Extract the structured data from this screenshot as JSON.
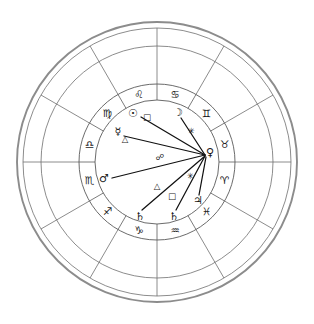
{
  "chart": {
    "type": "astrological-natal-wheel",
    "geometry": {
      "center_x": 157,
      "center_y": 162,
      "radius_outer_rim": 140,
      "radius_outer_circle": 134,
      "radius_house_wheel": 116,
      "radius_zodiac_outer": 78,
      "radius_zodiac_inner": 62,
      "radius_inner_area": 62
    },
    "colors": {
      "rim": "#8c8c8c",
      "line": "#6e6e6e",
      "zodiac_ring": "#5a5a5a",
      "aspect_line": "#111111",
      "glyph": "#1a1a1a",
      "background": "#ffffff"
    },
    "house_spokes_deg": [
      0,
      30,
      60,
      90,
      120,
      150,
      180,
      210,
      240,
      270,
      300,
      330
    ],
    "zodiac_signs": [
      {
        "name": "Cancer",
        "glyph": "♋",
        "angle_deg": 75,
        "label": "cancer"
      },
      {
        "name": "Leo",
        "glyph": "♌",
        "angle_deg": 105,
        "label": "leo"
      },
      {
        "name": "Virgo",
        "glyph": "♍",
        "angle_deg": 135,
        "label": "virgo"
      },
      {
        "name": "Libra",
        "glyph": "♎",
        "angle_deg": 165,
        "label": "libra"
      },
      {
        "name": "Scorpio",
        "glyph": "♏",
        "angle_deg": 195,
        "label": "scorpio"
      },
      {
        "name": "Sagittarius",
        "glyph": "♐",
        "angle_deg": 225,
        "label": "sagittarius"
      },
      {
        "name": "Capricorn",
        "glyph": "♑",
        "angle_deg": 255,
        "label": "capricorn"
      },
      {
        "name": "Aquarius",
        "glyph": "♒",
        "angle_deg": 285,
        "label": "aquarius"
      },
      {
        "name": "Pisces",
        "glyph": "♓",
        "angle_deg": 315,
        "label": "pisces"
      },
      {
        "name": "Aries",
        "glyph": "♈",
        "angle_deg": 345,
        "label": "aries"
      },
      {
        "name": "Taurus",
        "glyph": "♉",
        "angle_deg": 15,
        "label": "taurus"
      },
      {
        "name": "Gemini",
        "glyph": "♊",
        "angle_deg": 45,
        "label": "gemini"
      }
    ],
    "planets": [
      {
        "name": "Sun",
        "glyph": "☉",
        "x": 133,
        "y": 113,
        "label": "sun"
      },
      {
        "name": "Moon",
        "glyph": "☽",
        "x": 178,
        "y": 112,
        "label": "moon"
      },
      {
        "name": "Mercury",
        "glyph": "☿",
        "x": 118,
        "y": 131,
        "label": "mercury"
      },
      {
        "name": "Venus",
        "glyph": "♀",
        "x": 210,
        "y": 152,
        "label": "venus"
      },
      {
        "name": "Mars",
        "glyph": "♂",
        "x": 104,
        "y": 178,
        "label": "mars"
      },
      {
        "name": "Jupiter",
        "glyph": "♃",
        "x": 198,
        "y": 200,
        "label": "jupiter"
      },
      {
        "name": "Saturn",
        "glyph": "♄",
        "x": 140,
        "y": 216,
        "label": "saturn-1"
      },
      {
        "name": "Saturn",
        "glyph": "♄",
        "x": 174,
        "y": 216,
        "label": "saturn-2"
      }
    ],
    "aspect_markers": [
      {
        "name": "Square",
        "glyph": "□",
        "x": 147,
        "y": 117,
        "label": "square-sun-venus"
      },
      {
        "name": "Trine",
        "glyph": "△",
        "x": 125,
        "y": 139,
        "label": "trine-mercury-venus"
      },
      {
        "name": "Sextile",
        "glyph": "✳",
        "x": 191,
        "y": 131,
        "label": "sextile-upper"
      },
      {
        "name": "Opposition",
        "glyph": "☍",
        "x": 160,
        "y": 157,
        "label": "opposition-mars-venus"
      },
      {
        "name": "Sextile",
        "glyph": "✳",
        "x": 190,
        "y": 176,
        "label": "sextile-lower"
      },
      {
        "name": "Trine",
        "glyph": "△",
        "x": 157,
        "y": 186,
        "label": "trine-saturn-venus"
      },
      {
        "name": "Square",
        "glyph": "□",
        "x": 172,
        "y": 196,
        "label": "square-saturn-venus"
      }
    ],
    "aspect_lines": [
      {
        "from": "Sun",
        "x1": 141,
        "y1": 117,
        "x2": 205,
        "y2": 155,
        "label": "line-sun-venus"
      },
      {
        "from": "Moon",
        "x1": 181,
        "y1": 118,
        "x2": 205,
        "y2": 155,
        "label": "line-moon-venus"
      },
      {
        "from": "Mercury",
        "x1": 124,
        "y1": 136,
        "x2": 205,
        "y2": 155,
        "label": "line-mercury-venus"
      },
      {
        "from": "Mars",
        "x1": 112,
        "y1": 178,
        "x2": 205,
        "y2": 155,
        "label": "line-mars-venus"
      },
      {
        "from": "Saturn1",
        "x1": 142,
        "y1": 210,
        "x2": 205,
        "y2": 156,
        "label": "line-saturn1-venus"
      },
      {
        "from": "Saturn2",
        "x1": 176,
        "y1": 210,
        "x2": 205,
        "y2": 156,
        "label": "line-saturn2-venus"
      },
      {
        "from": "Jupiter",
        "x1": 199,
        "y1": 195,
        "x2": 206,
        "y2": 157,
        "label": "line-jupiter-venus"
      }
    ]
  }
}
